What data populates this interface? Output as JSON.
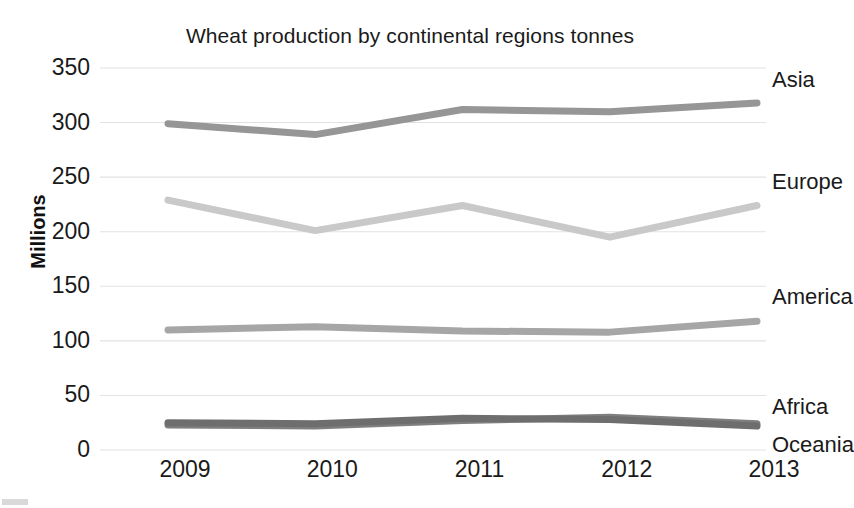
{
  "chart_data": {
    "type": "line",
    "title": "Wheat production by continental regions tonnes",
    "xlabel": "",
    "ylabel": "Millions",
    "categories": [
      "2009",
      "2010",
      "2011",
      "2012",
      "2013"
    ],
    "x": [
      2009,
      2010,
      2011,
      2012,
      2013
    ],
    "ylim": [
      0,
      350
    ],
    "yticks": [
      0,
      50,
      100,
      150,
      200,
      250,
      300,
      350
    ],
    "ytick_labels": [
      "0",
      "50",
      "100",
      "150",
      "200",
      "250",
      "300",
      "350"
    ],
    "grid": true,
    "legend_position": "inline-right",
    "series": [
      {
        "name": "Asia",
        "label": "Asia",
        "color": "#969696",
        "values": [
          299,
          289,
          312,
          310,
          318
        ]
      },
      {
        "name": "Europe",
        "label": "Europe",
        "color": "#c9c9c9",
        "values": [
          229,
          201,
          224,
          195,
          224
        ]
      },
      {
        "name": "America",
        "label": "America",
        "color": "#a6a6a6",
        "values": [
          110,
          113,
          109,
          108,
          118
        ]
      },
      {
        "name": "Africa",
        "label": "Africa",
        "color": "#7f7f7f",
        "values": [
          23,
          22,
          27,
          30,
          24
        ]
      },
      {
        "name": "Oceania",
        "label": "Oceania",
        "color": "#6e6e6e",
        "values": [
          25,
          24,
          29,
          28,
          22
        ]
      }
    ]
  },
  "chart": {
    "title": "Wheat production by continental regions tonnes",
    "y_axis_title": "Millions",
    "y_ticks": [
      {
        "label": "350",
        "value": 350
      },
      {
        "label": "300",
        "value": 300
      },
      {
        "label": "250",
        "value": 250
      },
      {
        "label": "200",
        "value": 200
      },
      {
        "label": "150",
        "value": 150
      },
      {
        "label": "100",
        "value": 100
      },
      {
        "label": "50",
        "value": 50
      },
      {
        "label": "0",
        "value": 0
      }
    ],
    "x_ticks": [
      {
        "label": "2009"
      },
      {
        "label": "2010"
      },
      {
        "label": "2011"
      },
      {
        "label": "2012"
      },
      {
        "label": "2013"
      }
    ],
    "series_labels": [
      {
        "label": "Asia"
      },
      {
        "label": "Europe"
      },
      {
        "label": "America"
      },
      {
        "label": "Africa"
      },
      {
        "label": "Oceania"
      }
    ],
    "colors": {
      "asia": "#969696",
      "europe": "#c9c9c9",
      "america": "#a6a6a6",
      "africa": "#7f7f7f",
      "oceania": "#6e6e6e",
      "gridline": "#e2e2e2",
      "text": "#1a1a1a",
      "background": "#ffffff"
    }
  }
}
